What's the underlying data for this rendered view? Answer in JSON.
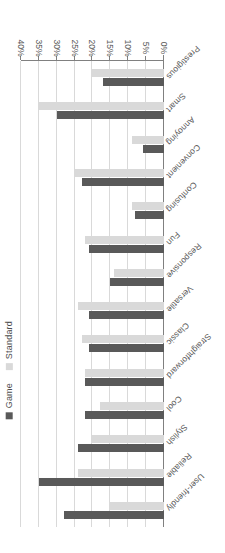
{
  "chart_data": {
    "type": "bar",
    "orientation": "horizontal",
    "title": "",
    "xlabel": "",
    "ylabel": "",
    "xlim": [
      0,
      40
    ],
    "xticks": [
      "0%",
      "5%",
      "10%",
      "15%",
      "20%",
      "25%",
      "30%",
      "35%",
      "40%"
    ],
    "grid": true,
    "legend_position": "left",
    "rotated_180": true,
    "categories": [
      "User-friendly",
      "Reliable",
      "Stylish",
      "Cool",
      "Straightforward",
      "Classic",
      "Versatile",
      "Responsive",
      "Fun",
      "Confusing",
      "Convenient",
      "Annoying",
      "Smart",
      "Prestigious"
    ],
    "series": [
      {
        "name": "Game",
        "color": "#595959",
        "values": [
          28,
          35,
          24,
          22,
          22,
          21,
          21,
          15,
          21,
          8,
          23,
          6,
          30,
          17
        ]
      },
      {
        "name": "Standard",
        "color": "#d9d9d9",
        "values": [
          15,
          24,
          20,
          18,
          22,
          23,
          24,
          14,
          22,
          9,
          25,
          9,
          35,
          20
        ]
      }
    ]
  },
  "legend": {
    "entries": [
      {
        "label": "Game",
        "color": "#595959"
      },
      {
        "label": "Standard",
        "color": "#d9d9d9"
      }
    ]
  }
}
